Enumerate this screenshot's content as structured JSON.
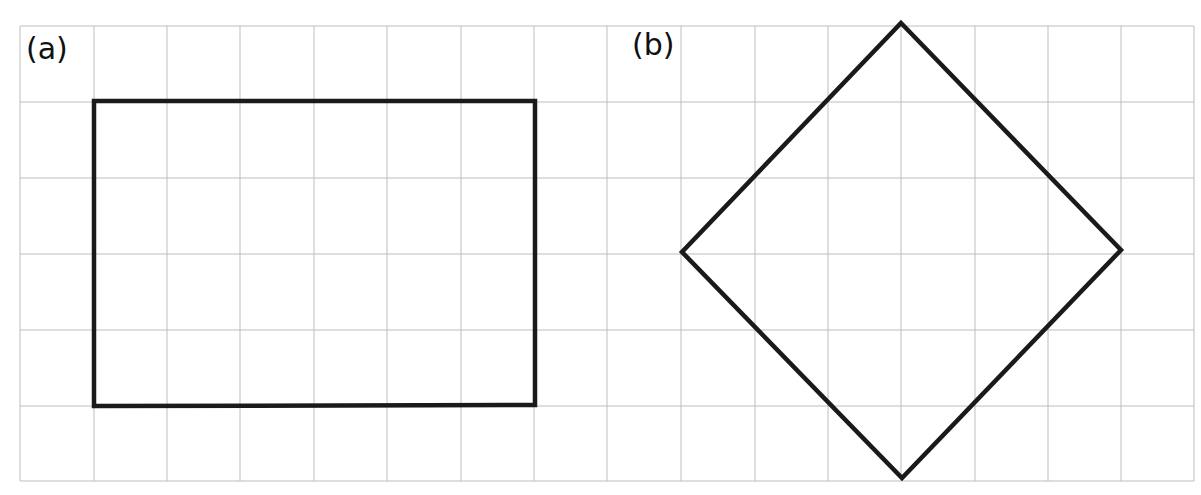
{
  "grid": {
    "x_lines": [
      20,
      94,
      167,
      240,
      314,
      387,
      461,
      534,
      607,
      681,
      755,
      828,
      901,
      975,
      1048,
      1121,
      1194
    ],
    "y_lines": [
      26,
      102,
      178,
      254,
      330,
      406,
      481
    ],
    "line_color": "#bdbdbd",
    "columns": 16,
    "rows": 6
  },
  "shapes": [
    {
      "id": "a",
      "label": "(a)",
      "label_pos": [
        26,
        34
      ],
      "type": "rectangle",
      "points": [
        [
          94,
          101
        ],
        [
          535,
          101
        ],
        [
          535,
          405
        ],
        [
          94,
          406
        ]
      ],
      "width_cells": 6,
      "height_cells": 4,
      "stroke": "#1a1a1a",
      "stroke_width": 4.5
    },
    {
      "id": "b",
      "label": "(b)",
      "label_pos": [
        632,
        30
      ],
      "type": "diamond",
      "points": [
        [
          901,
          23
        ],
        [
          1121,
          250
        ],
        [
          902,
          478
        ],
        [
          682,
          252
        ]
      ],
      "diagonal_cells_horizontal": 6,
      "diagonal_cells_vertical": 6,
      "stroke": "#1a1a1a",
      "stroke_width": 4.5
    }
  ]
}
